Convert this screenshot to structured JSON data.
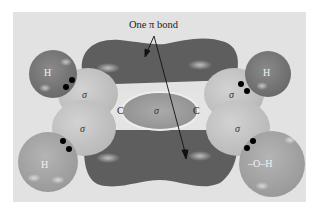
{
  "diagram": {
    "title_label": "One π bond",
    "atoms": {
      "h_top_left": "H",
      "h_top_right": "H",
      "h_bottom_left": "H",
      "c_left": "C",
      "c_right": "C",
      "oh_bottom_right": "–O–H"
    },
    "sigma_labels": {
      "top_left": "σ",
      "bottom_left": "σ",
      "center": "σ",
      "top_right": "σ",
      "bottom_right": "σ"
    },
    "colors": {
      "background": "#e2e2e2",
      "pi_lobe": "#5e5e5e",
      "hydrogen_top": "#7a7a7a",
      "hydrogen_bottom": "#a6a6a6",
      "sigma_lobe": "#c4c4c4",
      "electron": "#000000"
    }
  }
}
